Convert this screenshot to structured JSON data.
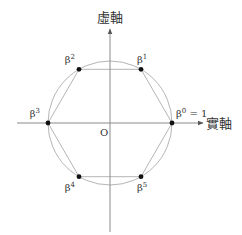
{
  "diagram": {
    "axes": {
      "real_label": "實軸",
      "imag_label": "虛軸",
      "origin_label": "O",
      "color": "#8a8a8a"
    },
    "circle": {
      "cx": 110,
      "cy": 123,
      "r": 62,
      "color": "#b5b5b5"
    },
    "hexagon_color": "#b5b5b5",
    "point_color": "#111111",
    "points": [
      {
        "name": "beta-0",
        "label": "β",
        "sup": "0",
        "suffix": " = 1",
        "angle_deg": 0
      },
      {
        "name": "beta-1",
        "label": "β",
        "sup": "1",
        "suffix": "",
        "angle_deg": 60
      },
      {
        "name": "beta-2",
        "label": "β",
        "sup": "2",
        "suffix": "",
        "angle_deg": 120
      },
      {
        "name": "beta-3",
        "label": "β",
        "sup": "3",
        "suffix": "",
        "angle_deg": 180
      },
      {
        "name": "beta-4",
        "label": "β",
        "sup": "4",
        "suffix": "",
        "angle_deg": 240
      },
      {
        "name": "beta-5",
        "label": "β",
        "sup": "5",
        "suffix": "",
        "angle_deg": 300
      }
    ]
  }
}
